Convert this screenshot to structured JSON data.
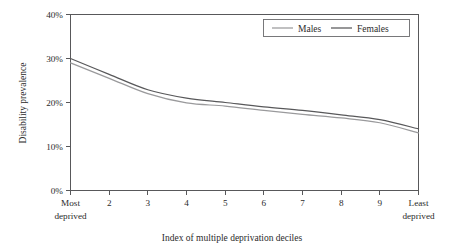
{
  "chart_data": {
    "type": "line",
    "title": "",
    "xlabel": "Index of multiple deprivation deciles",
    "ylabel": "Disability prevalence",
    "categories": [
      "Most deprived",
      "2",
      "3",
      "4",
      "5",
      "6",
      "7",
      "8",
      "9",
      "Least deprived"
    ],
    "x": [
      1,
      2,
      3,
      4,
      5,
      6,
      7,
      8,
      9,
      10
    ],
    "series": [
      {
        "name": "Males",
        "color": "#9a9a9c",
        "values": [
          29.0,
          25.5,
          22.0,
          19.9,
          19.2,
          18.2,
          17.3,
          16.5,
          15.4,
          13.1
        ]
      },
      {
        "name": "Females",
        "color": "#58585a",
        "values": [
          30.0,
          26.4,
          22.9,
          21.0,
          20.0,
          19.0,
          18.2,
          17.2,
          16.1,
          14.0
        ]
      }
    ],
    "ylim": [
      0,
      40
    ],
    "yticks": [
      0,
      10,
      20,
      30,
      40
    ],
    "ytick_labels": [
      "0%",
      "10%",
      "20%",
      "30%",
      "40%"
    ],
    "xtick_labels": [
      "Most deprived",
      "2",
      "3",
      "4",
      "5",
      "6",
      "7",
      "8",
      "9",
      "Least deprived"
    ],
    "grid": false,
    "legend_position": "top-right",
    "legend_entries": [
      "Males",
      "Females"
    ]
  },
  "axes": {
    "y_title": "Disability prevalence",
    "x_title": "Index of multiple deprivation deciles",
    "y_tick_0": "0%",
    "y_tick_1": "10%",
    "y_tick_2": "20%",
    "y_tick_3": "30%",
    "y_tick_4": "40%",
    "x_tick_1_line1": "Most",
    "x_tick_1_line2": "deprived",
    "x_tick_2": "2",
    "x_tick_3": "3",
    "x_tick_4": "4",
    "x_tick_5": "5",
    "x_tick_6": "6",
    "x_tick_7": "7",
    "x_tick_8": "8",
    "x_tick_9": "9",
    "x_tick_10_line1": "Least",
    "x_tick_10_line2": "deprived"
  },
  "legend": {
    "males_label": "Males",
    "females_label": "Females",
    "males_color": "#9a9a9c",
    "females_color": "#58585a"
  }
}
